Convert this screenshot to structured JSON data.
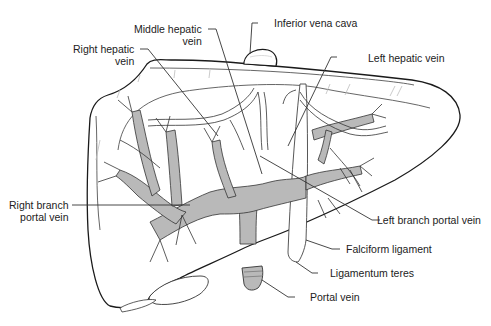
{
  "figure": {
    "colors": {
      "outline": "#1a1a1a",
      "portal_fill": "#b9b9b9",
      "hepatic_fill": "#ffffff",
      "leader": "#333333",
      "label_text": "#222222"
    }
  },
  "labels": {
    "middle_hepatic_vein": {
      "line1": "Middle hepatic",
      "line2": "vein"
    },
    "right_hepatic_vein": {
      "line1": "Right hepatic",
      "line2": "vein"
    },
    "inferior_vena_cava": {
      "text": "Inferior vena cava"
    },
    "left_hepatic_vein": {
      "text": "Left hepatic vein"
    },
    "right_branch_portal_vein": {
      "line1": "Right branch",
      "line2": "portal vein"
    },
    "left_branch_portal_vein": {
      "text": "Left branch portal vein"
    },
    "falciform_ligament": {
      "text": "Falciform ligament"
    },
    "ligamentum_teres": {
      "text": "Ligamentum teres"
    },
    "portal_vein": {
      "text": "Portal vein"
    }
  }
}
